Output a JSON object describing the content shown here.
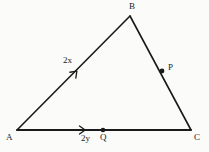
{
  "figure": {
    "kind": "geometry-diagram",
    "shape": "triangle",
    "background_color": "#fbfbf9",
    "stroke_color": "#1a1a1a",
    "text_color": "#1a1a1a",
    "canvas": {
      "width": 209,
      "height": 152
    },
    "vertices": [
      {
        "id": "A",
        "label": "A",
        "x": 17,
        "y": 130
      },
      {
        "id": "B",
        "label": "B",
        "x": 130,
        "y": 16
      },
      {
        "id": "C",
        "label": "C",
        "x": 191,
        "y": 130
      }
    ],
    "sides": [
      {
        "id": "AB",
        "from": "A",
        "to": "B"
      },
      {
        "id": "BC",
        "from": "B",
        "to": "C"
      },
      {
        "id": "AC",
        "from": "A",
        "to": "C"
      }
    ],
    "marked_points": [
      {
        "id": "P",
        "label": "P",
        "on_side": "BC",
        "x": 162,
        "y": 71
      },
      {
        "id": "Q",
        "label": "Q",
        "on_side": "AC",
        "x": 103,
        "y": 130
      }
    ],
    "tick_marks": [
      {
        "id": "mark-AB",
        "on_side": "AB",
        "style": "single-chevron-arrow",
        "label": "2x",
        "x": 76,
        "y": 72,
        "angle_deg": -45.3
      },
      {
        "id": "mark-AC",
        "on_side": "AC",
        "style": "single-chevron-arrow",
        "label": "2y",
        "x": 84,
        "y": 130,
        "angle_deg": 0
      }
    ],
    "labels": {
      "A": "A",
      "B": "B",
      "C": "C",
      "P": "P",
      "Q": "Q",
      "measure_ab": "2x",
      "measure_aq": "2y"
    }
  }
}
